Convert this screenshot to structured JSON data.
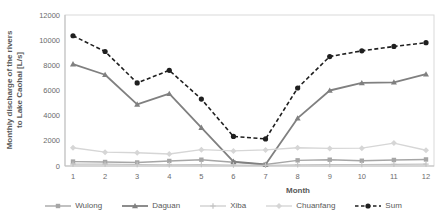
{
  "chart_data": {
    "type": "line",
    "title": "",
    "xlabel": "Month",
    "ylabel": "Monthly discharge of the rivers to Lake Caohai [L/s]",
    "ylabel_lines": [
      "Monthly discharge of the rivers",
      "to Lake Caohai [L/s]"
    ],
    "categories": [
      "1",
      "2",
      "3",
      "4",
      "5",
      "6",
      "7",
      "8",
      "9",
      "10",
      "11",
      "12"
    ],
    "ylim": [
      0,
      12000
    ],
    "y_ticks": [
      0,
      2000,
      4000,
      6000,
      8000,
      10000,
      12000
    ],
    "grid": false,
    "legend_position": "bottom",
    "series": [
      {
        "name": "Wulong",
        "marker": "square",
        "color": "#a6a6a6",
        "dash": "solid",
        "line_width": 1.4,
        "values": [
          350,
          320,
          280,
          400,
          500,
          300,
          120,
          450,
          500,
          420,
          480,
          520
        ]
      },
      {
        "name": "Daguan",
        "marker": "triangle",
        "color": "#808080",
        "dash": "solid",
        "line_width": 1.8,
        "values": [
          8100,
          7250,
          4900,
          5750,
          3050,
          350,
          120,
          3800,
          6000,
          6600,
          6650,
          7300
        ]
      },
      {
        "name": "Xiba",
        "marker": "plus",
        "color": "#c3c3c3",
        "dash": "solid",
        "line_width": 1.1,
        "values": [
          150,
          150,
          120,
          100,
          120,
          80,
          60,
          100,
          120,
          120,
          130,
          150
        ]
      },
      {
        "name": "Chuanfang",
        "marker": "diamond",
        "color": "#d6d6d6",
        "dash": "solid",
        "line_width": 1.4,
        "values": [
          1450,
          1100,
          1050,
          950,
          1300,
          1200,
          1280,
          1450,
          1400,
          1420,
          1820,
          1250
        ]
      },
      {
        "name": "Sum",
        "marker": "circle",
        "color": "#1f1f1f",
        "dash": "dashed",
        "line_width": 1.6,
        "values": [
          10350,
          9100,
          6600,
          7600,
          5320,
          2350,
          2150,
          6200,
          8700,
          9150,
          9500,
          9800
        ]
      }
    ],
    "colors": {
      "background": "#ffffff",
      "plot_border": "#d9d9d9",
      "axis_line": "#bfbfbf",
      "axis_text": "#6b6b6b",
      "axis_title_text": "#595959"
    }
  }
}
